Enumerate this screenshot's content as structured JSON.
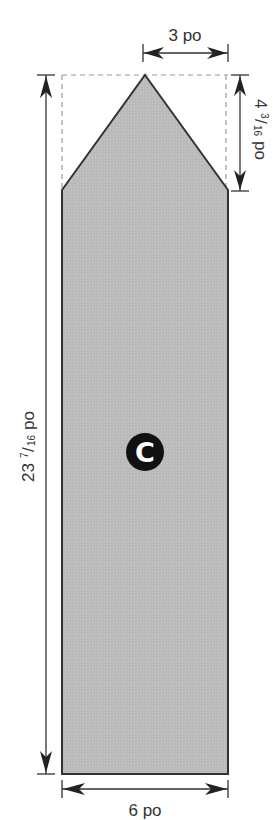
{
  "diagram": {
    "type": "sewing-pattern-piece",
    "piece_label": "C",
    "fill_color": "#bdbdbd",
    "outline_color": "#333333",
    "badge_color": "#111111",
    "badge_text_color": "#ffffff",
    "dimensions": {
      "top_width": {
        "whole": "3",
        "unit": "po",
        "label": "3 po"
      },
      "point_height": {
        "whole": "4",
        "num": "3",
        "den": "16",
        "unit": "po",
        "label": "4 3/16 po"
      },
      "total_height": {
        "whole": "23",
        "num": "7",
        "den": "16",
        "unit": "po",
        "label": "23 7/16 po"
      },
      "bottom_width": {
        "whole": "6",
        "unit": "po",
        "label": "6 po"
      }
    }
  }
}
